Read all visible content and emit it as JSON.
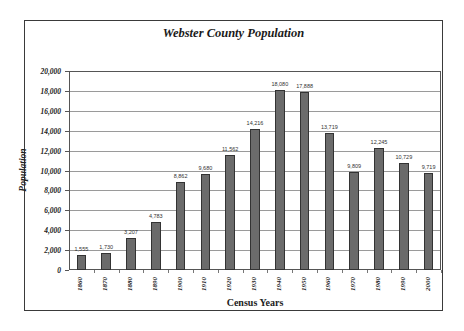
{
  "chart_data": {
    "type": "bar",
    "title": "Webster County Population",
    "xlabel": "Census Years",
    "ylabel": "Population",
    "categories": [
      "1860",
      "1870",
      "1880",
      "1890",
      "1900",
      "1910",
      "1920",
      "1930",
      "1940",
      "1950",
      "1960",
      "1970",
      "1980",
      "1990",
      "2000"
    ],
    "values": [
      1555,
      1730,
      3207,
      4783,
      8862,
      9680,
      11562,
      14216,
      18080,
      17888,
      13719,
      9809,
      12245,
      10729,
      9719
    ],
    "value_labels": [
      "1,555",
      "1,730",
      "3,207",
      "4,783",
      "8,862",
      "9,680",
      "11,562",
      "14,216",
      "18,080",
      "17,888",
      "13,719",
      "9,809",
      "12,245",
      "10,729",
      "9,719"
    ],
    "ylim": [
      0,
      20000
    ],
    "yticks": [
      0,
      2000,
      4000,
      6000,
      8000,
      10000,
      12000,
      14000,
      16000,
      18000,
      20000
    ],
    "ytick_labels": [
      "0",
      "2,000",
      "4,000",
      "6,000",
      "8,000",
      "10,000",
      "12,000",
      "14,000",
      "16,000",
      "18,000",
      "20,000"
    ],
    "grid": true,
    "legend": null,
    "colors": {
      "bar_fill": "#6b6b6b",
      "bar_edge": "#333333",
      "grid": "#9a9a9a"
    }
  }
}
